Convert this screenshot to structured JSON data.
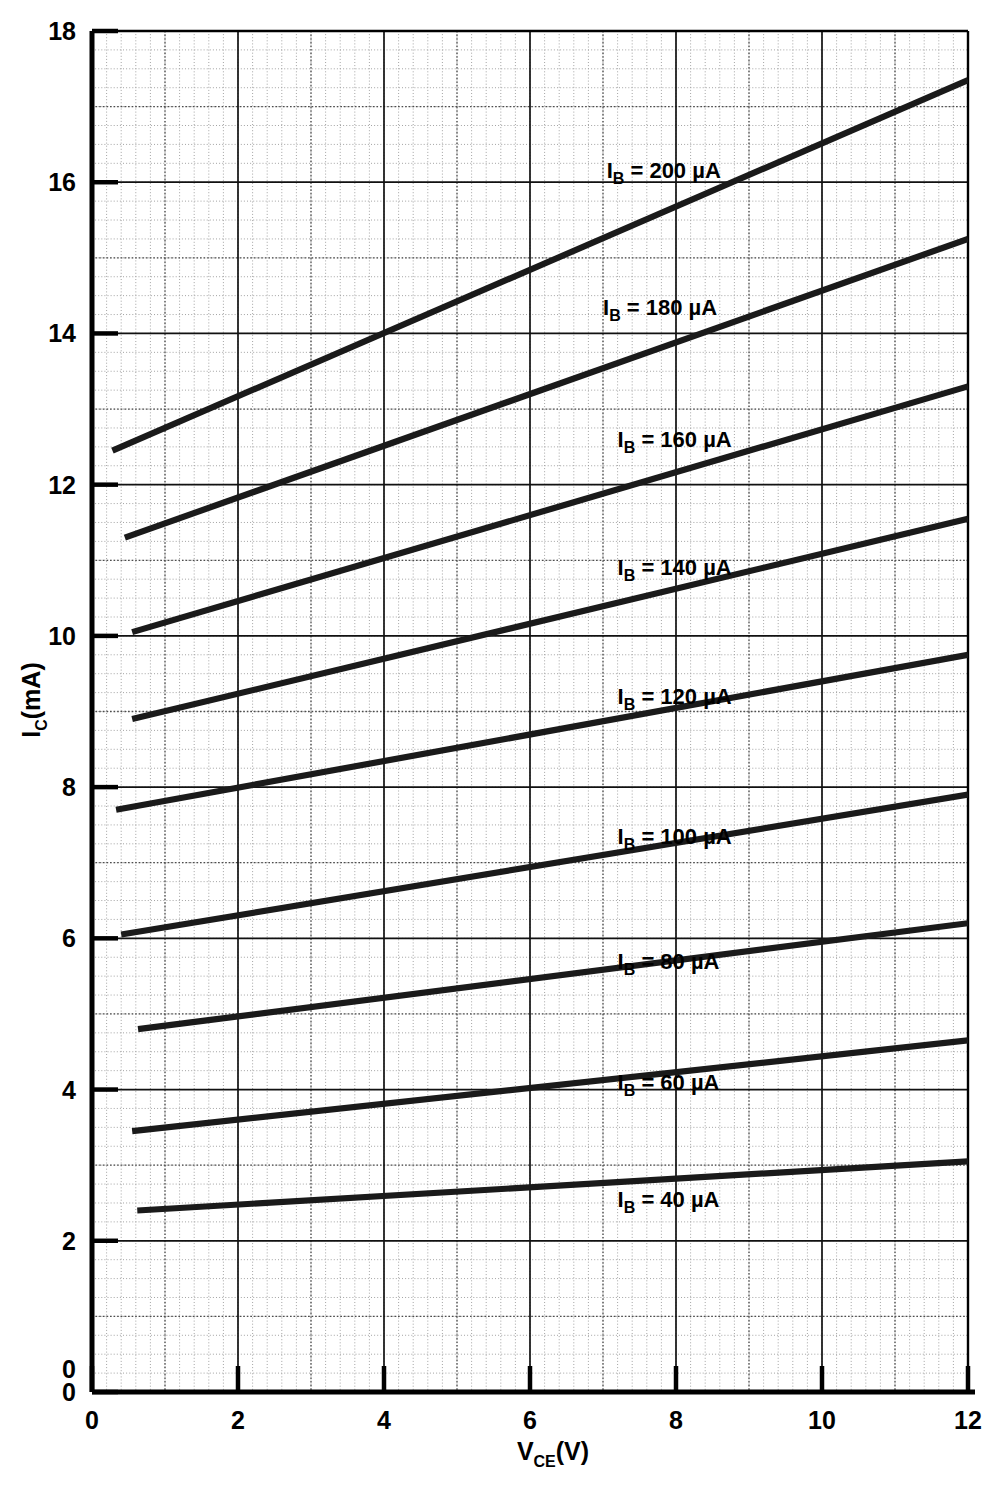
{
  "axes": {
    "x_title_main": "V",
    "x_title_sub": "CE",
    "x_title_unit": "(V)",
    "y_title_main": "I",
    "y_title_sub": "C",
    "y_title_unit": "(mA)",
    "x_ticks": [
      "0",
      "2",
      "4",
      "6",
      "8",
      "10",
      "12"
    ],
    "y_ticks": [
      "0",
      "2",
      "4",
      "6",
      "8",
      "10",
      "12",
      "14",
      "16",
      "18"
    ],
    "origin_extra_label": "0"
  },
  "chart_data": {
    "type": "line",
    "title": "",
    "xlabel": "V_CE (V)",
    "ylabel": "I_C (mA)",
    "xlim": [
      0,
      12
    ],
    "ylim": [
      0,
      18
    ],
    "grid": true,
    "legend_position": "inline-right",
    "x_tick_values": [
      0,
      2,
      4,
      6,
      8,
      10,
      12
    ],
    "y_tick_values": [
      0,
      2,
      4,
      6,
      8,
      10,
      12,
      14,
      16,
      18
    ],
    "minor_grid_x_step": 0.2,
    "minor_grid_y_step": 0.25,
    "series": [
      {
        "name": "I_B = 40 µA",
        "label_prefix": "I",
        "label_sub": "B",
        "label_rest": " = 40 µA",
        "label_x": 7.2,
        "label_y": 2.45,
        "x": [
          0.62,
          12.0
        ],
        "values": [
          2.4,
          3.05
        ]
      },
      {
        "name": "I_B = 60 µA",
        "label_prefix": "I",
        "label_sub": "B",
        "label_rest": " = 60 µA",
        "label_x": 7.2,
        "label_y": 4.0,
        "x": [
          0.55,
          12.0
        ],
        "values": [
          3.45,
          4.65
        ]
      },
      {
        "name": "I_B = 80 µA",
        "label_prefix": "I",
        "label_sub": "B",
        "label_rest": " = 80 µA",
        "label_x": 7.2,
        "label_y": 5.6,
        "x": [
          0.63,
          12.0
        ],
        "values": [
          4.8,
          6.2
        ]
      },
      {
        "name": "I_B = 100 µA",
        "label_prefix": "I",
        "label_sub": "B",
        "label_rest": " = 100 µA",
        "label_x": 7.2,
        "label_y": 7.25,
        "x": [
          0.4,
          12.0
        ],
        "values": [
          6.05,
          7.9
        ]
      },
      {
        "name": "I_B = 120 µA",
        "label_prefix": "I",
        "label_sub": "B",
        "label_rest": " = 120 µA",
        "label_x": 7.2,
        "label_y": 9.1,
        "x": [
          0.33,
          12.0
        ],
        "values": [
          7.7,
          9.75
        ]
      },
      {
        "name": "I_B = 140 µA",
        "label_prefix": "I",
        "label_sub": "B",
        "label_rest": " = 140 µA",
        "label_x": 7.2,
        "label_y": 10.8,
        "x": [
          0.55,
          12.0
        ],
        "values": [
          8.9,
          11.55
        ]
      },
      {
        "name": "I_B = 160 µA",
        "label_prefix": "I",
        "label_sub": "B",
        "label_rest": " = 160 µA",
        "label_x": 7.2,
        "label_y": 12.5,
        "x": [
          0.55,
          12.0
        ],
        "values": [
          10.05,
          13.3
        ]
      },
      {
        "name": "I_B = 180 µA",
        "label_prefix": "I",
        "label_sub": "B",
        "label_rest": " = 180 µA",
        "label_x": 7.0,
        "label_y": 14.25,
        "x": [
          0.45,
          12.0
        ],
        "values": [
          11.3,
          15.25
        ]
      },
      {
        "name": "I_B = 200 µA",
        "label_prefix": "I",
        "label_sub": "B",
        "label_rest": " = 200 µA",
        "label_x": 7.05,
        "label_y": 16.05,
        "x": [
          0.28,
          12.0
        ],
        "values": [
          12.45,
          17.35
        ]
      }
    ]
  },
  "style": {
    "curve_color": "#1a1a1a",
    "axis_color": "#000000",
    "major_grid_color": "#4d4d4d",
    "minor_grid_color": "#9a9a9a",
    "background": "#ffffff"
  }
}
